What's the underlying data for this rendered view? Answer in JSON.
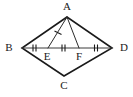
{
  "figure": {
    "canvas": {
      "width": 133,
      "height": 97,
      "background": "#ffffff"
    },
    "stroke_color": "#1a1a1a",
    "thin_stroke_color": "#3a3a3a",
    "vertices": [
      {
        "id": "A",
        "label": "A",
        "x": 67,
        "y": 17,
        "label_x": 67,
        "label_y": 7
      },
      {
        "id": "B",
        "label": "B",
        "x": 22,
        "y": 48,
        "label_x": 9,
        "label_y": 48
      },
      {
        "id": "C",
        "label": "C",
        "x": 64,
        "y": 76,
        "label_x": 64,
        "label_y": 86
      },
      {
        "id": "D",
        "label": "D",
        "x": 112,
        "y": 48,
        "label_x": 124,
        "label_y": 48
      },
      {
        "id": "E",
        "label": "E",
        "x": 48,
        "y": 48,
        "label_x": 47,
        "label_y": 57
      },
      {
        "id": "F",
        "label": "F",
        "x": 79,
        "y": 48,
        "label_x": 79,
        "label_y": 57
      }
    ],
    "sides": [
      {
        "name": "side-AB",
        "from": "A",
        "to": "B"
      },
      {
        "name": "side-BC",
        "from": "B",
        "to": "C"
      },
      {
        "name": "side-CD",
        "from": "C",
        "to": "D"
      },
      {
        "name": "side-DA",
        "from": "D",
        "to": "A"
      }
    ],
    "diagonal": {
      "name": "diagonal-BD",
      "from": "B",
      "to": "D"
    },
    "cevians": [
      {
        "name": "segment-AE",
        "from": "A",
        "to": "E"
      },
      {
        "name": "segment-AF",
        "from": "A",
        "to": "F"
      }
    ],
    "tick_marks": [
      {
        "name": "tick-BE",
        "segment": "BE",
        "count": 2,
        "x": 35,
        "y": 48,
        "orientation": "vertical"
      },
      {
        "name": "tick-EF",
        "segment": "EF",
        "count": 2,
        "x": 64,
        "y": 48,
        "orientation": "vertical"
      },
      {
        "name": "tick-FD",
        "segment": "FD",
        "count": 2,
        "x": 96,
        "y": 48,
        "orientation": "vertical"
      },
      {
        "name": "tick-AE",
        "segment": "AE",
        "count": 1,
        "x": 58,
        "y": 32,
        "orientation": "slanted"
      }
    ],
    "labels": {
      "A": "A",
      "B": "B",
      "C": "C",
      "D": "D",
      "E": "E",
      "F": "F"
    }
  }
}
